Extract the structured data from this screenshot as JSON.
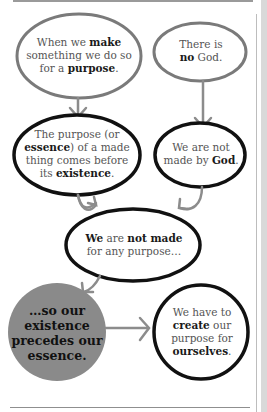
{
  "nodes": {
    "make_purpose": {
      "line1_pre": "When we ",
      "line1_bold": "make",
      "line2": "something we do so",
      "line3_pre": "for a ",
      "line3_bold": "purpose",
      "line3_post": "."
    },
    "no_god": {
      "line1": "There is",
      "line2_bold": "no",
      "line2_post": " God."
    },
    "essence_before": {
      "line1": "The purpose (or",
      "line2_bold": "essence",
      "line2_post": ") of a made",
      "line3": "thing comes before",
      "line4_pre": "its ",
      "line4_bold": "existence",
      "line4_post": "."
    },
    "not_made_by_god": {
      "line1": "We are not",
      "line2_pre": "made by ",
      "line2_bold": "God",
      "line2_post": "."
    },
    "not_made_for_purpose": {
      "line1_bold1": "We",
      "line1_mid": " are ",
      "line1_bold2": "not made",
      "line2": "for any purpose…"
    },
    "existence_precedes": {
      "line1": "…so our",
      "line2": "existence",
      "line3": "precedes our",
      "line4": "essence."
    },
    "create_purpose": {
      "line1": "We have to",
      "line2_bold": "create",
      "line2_post": " our",
      "line3": "purpose for",
      "line4_bold": "ourselves",
      "line4_post": "."
    }
  },
  "colors": {
    "light_outline": "#7a7a7a",
    "dark_outline": "#111111",
    "arrow": "#8c8c8c",
    "filled_circle": "#8a8a8a"
  }
}
